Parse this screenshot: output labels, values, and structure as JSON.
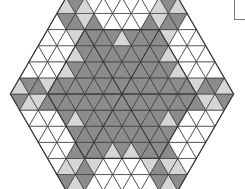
{
  "figure": {
    "colors": {
      "background": "#ffffff",
      "dark": "#8c8c8c",
      "light": "#d6d6d6",
      "white": "#ffffff",
      "stroke": "#3a3a3a"
    },
    "geometry": {
      "center": [
        122,
        94
      ],
      "unit": 18.6,
      "outer_hex_side_units": 6,
      "inner_hex_side_units": 4
    }
  }
}
